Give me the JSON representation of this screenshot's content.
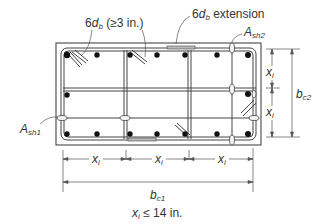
{
  "diagram": {
    "type": "column-cross-section-transverse-reinforcement",
    "labels": {
      "hook_main": "6",
      "hook_db": "d",
      "hook_db_sub": "b",
      "hook_limit": "(≥3 in.)",
      "extension_main": "6",
      "extension_db": "d",
      "extension_db_sub": "b",
      "extension_text": "extension",
      "ash2_A": "A",
      "ash2_sub": "sh2",
      "ash1_A": "A",
      "ash1_sub": "sh1",
      "xi": "x",
      "xi_sub": "i",
      "bc2": "b",
      "bc2_sub": "c2",
      "bc1": "b",
      "bc1_sub": "c1",
      "limit_x": "x",
      "limit_sub": "i",
      "limit_text": "≤ 14 in."
    },
    "colors": {
      "line": "#333333",
      "bar": "#111111",
      "tie_fill": "#e8e8e8"
    },
    "longitudinal_bars": {
      "top_row": 7,
      "middle_row": 2,
      "bottom_row": 7
    },
    "spacings": {
      "horizontal": [
        "x_i",
        "x_i",
        "x_i"
      ],
      "vertical": [
        "x_i",
        "x_i"
      ]
    }
  }
}
